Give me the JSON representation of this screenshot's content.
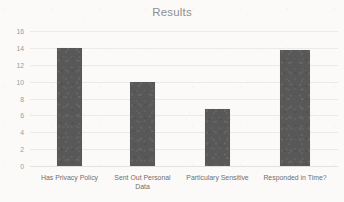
{
  "chart_data": {
    "type": "bar",
    "title": "Results",
    "xlabel": "",
    "ylabel": "",
    "categories": [
      "Has Privacy Policy",
      "Sent Out Personal Data",
      "Particulary Sensitive",
      "Responded in Time?"
    ],
    "values": [
      14,
      9.9,
      6.8,
      13.8
    ],
    "ylim": [
      0,
      16
    ],
    "yticks": [
      0,
      2,
      4,
      6,
      8,
      10,
      12,
      14,
      16
    ],
    "ytick_labels": [
      "0",
      "2",
      "4",
      "6",
      "8",
      "10",
      "12",
      "14",
      "16"
    ],
    "grid": true,
    "legend": false,
    "legend_position": "none",
    "bar_color": "#585858",
    "title_color": "#8e8e8e",
    "tick_color": "#9a9a9a",
    "label_color": "#6f6f6f",
    "gridline_color": "#eceae8",
    "background_color": "#fbfaf8"
  }
}
